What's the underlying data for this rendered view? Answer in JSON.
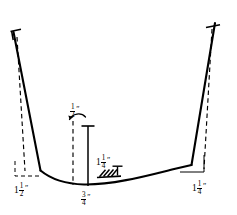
{
  "figure": {
    "title": "",
    "type": "technical-cross-section-diagram",
    "units": "inches",
    "ink_color": "#000000",
    "background_color": "#ffffff",
    "dimensions": [
      {
        "id": "left-bottom",
        "whole": "1",
        "numerator": "1",
        "denominator": "2",
        "unit_mark": "″",
        "position": "bottom-left"
      },
      {
        "id": "center-top",
        "whole": "",
        "numerator": "1",
        "denominator": "2",
        "unit_mark": "″",
        "position": "center-upper"
      },
      {
        "id": "mid-right",
        "whole": "1",
        "numerator": "1",
        "denominator": "4",
        "unit_mark": "″",
        "position": "center-right-of-axis"
      },
      {
        "id": "bottom-center",
        "whole": "",
        "numerator": "3",
        "denominator": "4",
        "unit_mark": "″",
        "position": "bottom-center"
      },
      {
        "id": "right-bottom",
        "whole": "1",
        "numerator": "1",
        "denominator": "4",
        "unit_mark": "″",
        "position": "bottom-right"
      }
    ]
  },
  "geometry": {
    "profile_solid_path": "M 14 33 L 40 170 C 60 181 78 184 96 183 C 120 181 150 173 176 168 L 192 165 L 215 24",
    "left_dashed_path": "M 17 37 L 24 170",
    "right_dashed_path": "M 212 28 L 205 168",
    "left_bracket_path": "M 14 160 L 14 175 L 41 175",
    "right_bracket_path": "M 205 157 L 205 173 L 179 173",
    "center_dashed_vertical": "M 73 122 L 73 186",
    "center_solid_vertical": "M 88 125 L 88 187",
    "center_solid_cap": "M 81 126 L 95 126",
    "arrow_arc": "M 72 118 C 74 112 82 111 86 116",
    "top_left_tick": "M 11 31 L 20 29",
    "top_left_tick_v": "M 12 31 L 13 39",
    "top_right_tick": "M 207 27 L 219 25",
    "hatch_marks": [
      "M 100 174 L 106 168",
      "M 104 175 L 110 169",
      "M 108 176 L 114 170",
      "M 112 176 L 118 170"
    ],
    "hatch_base": "M 98 177 L 120 176",
    "hatch_tee": "M 116 166 L 116 175",
    "hatch_tee_cap": "M 111 166 L 121 166"
  }
}
